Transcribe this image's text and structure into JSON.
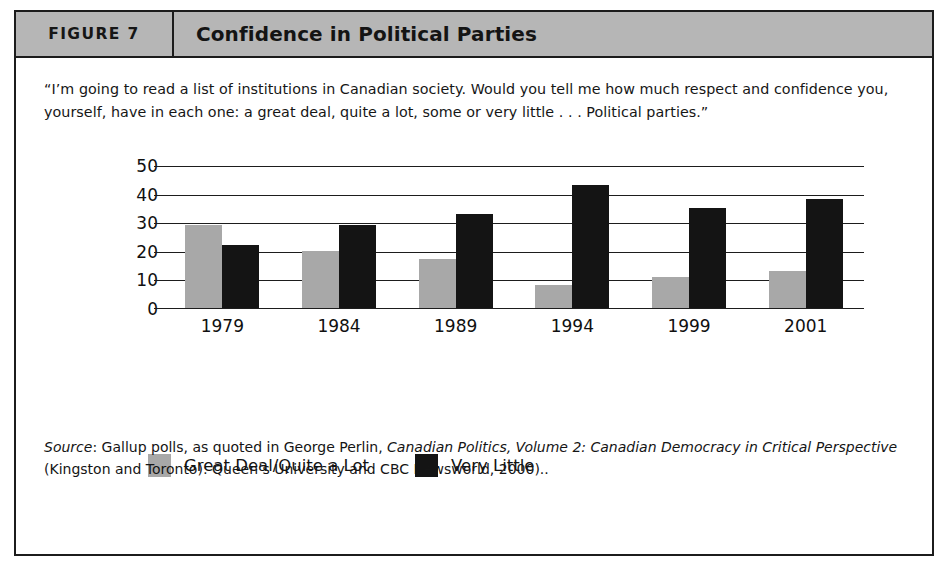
{
  "figure": {
    "number_label": "FIGURE 7",
    "title": "Confidence in Political Parties",
    "quote": "“I’m going to read a list of institutions in Canadian society. Would you tell me how much respect and confidence you, yourself, have in each one: a great deal, quite a lot, some or very little . . . Political parties.”",
    "source": {
      "label": "Source",
      "text_part1": ": Gallup polls, as quoted in George Perlin, ",
      "italic_title": "Canadian Politics, Volume 2: Canadian Democracy in Critical Perspective",
      "text_part2": " (Kingston and Toronto): Queen’s University and CBC Newsworld, 2000).."
    }
  },
  "colors": {
    "series_a": "#a8a8a8",
    "series_b": "#141414",
    "header_band": "#b6b6b6",
    "frame": "#1c1c1c"
  },
  "chart_data": {
    "type": "bar",
    "title": "Confidence in Political Parties",
    "xlabel": "",
    "ylabel": "",
    "categories": [
      "1979",
      "1984",
      "1989",
      "1994",
      "1999",
      "2001"
    ],
    "series": [
      {
        "name": "Great Deal/Quite a Lot",
        "color": "#a8a8a8",
        "values": [
          29,
          20,
          17,
          8,
          11,
          13
        ]
      },
      {
        "name": "Very Little",
        "color": "#141414",
        "values": [
          22,
          29,
          33,
          43,
          35,
          38
        ]
      }
    ],
    "ylim": [
      0,
      50
    ],
    "yticks": [
      0,
      10,
      20,
      30,
      40,
      50
    ],
    "ytick_labels": [
      "0",
      "10",
      "20",
      "30",
      "40",
      "50"
    ],
    "grid": true,
    "legend_position": "bottom-left"
  }
}
